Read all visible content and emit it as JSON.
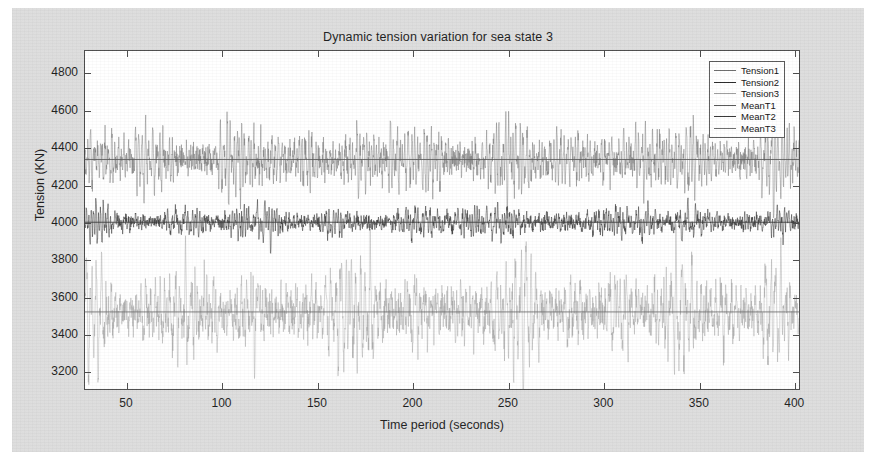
{
  "chart_data": {
    "type": "line",
    "title": "Dynamic tension variation for sea state 3",
    "xlabel": "Time period (seconds)",
    "ylabel": "Tension (KN)",
    "xlim": [
      28,
      403
    ],
    "ylim": [
      3100,
      4920
    ],
    "xticks": [
      50,
      100,
      150,
      200,
      250,
      300,
      350,
      400
    ],
    "yticks": [
      3200,
      3400,
      3600,
      3800,
      4000,
      4200,
      4400,
      4600,
      4800
    ],
    "grid": false,
    "legend_position": "upper right",
    "series": [
      {
        "name": "Tension1",
        "kind": "timeseries",
        "color": "#6e6e6e",
        "mean": 4336,
        "amplitude": 430,
        "note": "upper band oscillating about MeanT1"
      },
      {
        "name": "Tension2",
        "kind": "timeseries",
        "color": "#2a2a2a",
        "mean": 3998,
        "amplitude": 210,
        "note": "dense dark mid band about MeanT2"
      },
      {
        "name": "Tension3",
        "kind": "timeseries",
        "color": "#9a9a9a",
        "mean": 3515,
        "amplitude": 620,
        "note": "widest light band, peaks near 4900 and troughs near 3150"
      },
      {
        "name": "MeanT1",
        "kind": "hline",
        "color": "#555555",
        "value": 4336
      },
      {
        "name": "MeanT2",
        "kind": "hline",
        "color": "#333333",
        "value": 3998
      },
      {
        "name": "MeanT3",
        "kind": "hline",
        "color": "#6a6a6a",
        "value": 3515
      }
    ]
  },
  "legend": {
    "items": [
      {
        "label": "Tension1",
        "color": "#6e6e6e"
      },
      {
        "label": "Tension2",
        "color": "#2a2a2a"
      },
      {
        "label": "Tension3",
        "color": "#9a9a9a"
      },
      {
        "label": "MeanT1",
        "color": "#555555"
      },
      {
        "label": "MeanT2",
        "color": "#333333"
      },
      {
        "label": "MeanT3",
        "color": "#6a6a6a"
      }
    ]
  }
}
